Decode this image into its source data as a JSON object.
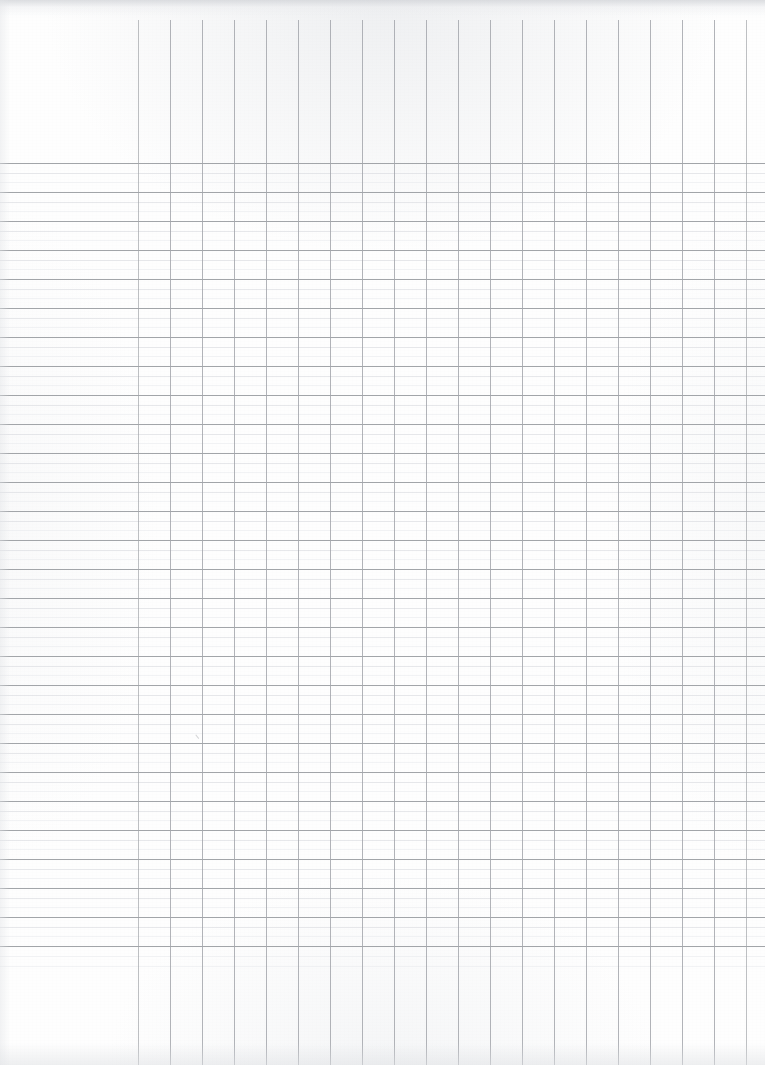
{
  "document": {
    "kind": "blank-columnar-ledger-paper",
    "title": "Blank Columnar Ledger Paper",
    "description": "Scanned sheet of blank accounting / columnar ledger paper with no printed text, no headings and no handwritten entries.",
    "orientation": "portrait",
    "page_width_px": 765,
    "page_height_px": 1065,
    "paper_color": "#fefefe",
    "has_text_content": false,
    "visible_text": []
  },
  "grid": {
    "description_column": {
      "name": "description-column",
      "left_px": 0,
      "right_px": 138,
      "width_px": 138,
      "has_vertical_rules": false
    },
    "vertical_rules": {
      "count": 20,
      "first_x_px": 138,
      "spacing_px": 32,
      "last_x_px": 746,
      "start_y_px": 20,
      "end_y_px": 1065,
      "color": "#a3a6ab",
      "weight_px": 1,
      "x_positions": [
        138,
        170,
        202,
        234,
        266,
        298,
        330,
        362,
        394,
        426,
        458,
        490,
        522,
        554,
        586,
        618,
        650,
        682,
        714,
        746
      ]
    },
    "money_columns": {
      "count": 19,
      "note": "Narrow amount columns formed between adjacent vertical rules."
    },
    "horizontal_rules": {
      "major_count": 28,
      "first_major_y_px": 163,
      "major_spacing_px": 29,
      "last_major_y_px": 946,
      "major_color": "#9a9da2",
      "minor_per_cell": 2,
      "minor_color": "#d8dade",
      "hair_color": "#e7e9ec",
      "weight_px": 1,
      "top_margin_y_px": 155,
      "bottom_margin_y_px": 960
    },
    "writing_rows": {
      "count": 27,
      "row_height_px": 29
    }
  },
  "marks": [
    {
      "name": "stray-pencil-tick",
      "x_px": 196,
      "y_px": 732,
      "kind": "faint pencil tick",
      "text": ""
    }
  ],
  "chart_data": {
    "type": "table",
    "xlabel": "",
    "ylabel": "",
    "columns": [
      "Description",
      "1",
      "2",
      "3",
      "4",
      "5",
      "6",
      "7",
      "8",
      "9",
      "10",
      "11",
      "12",
      "13",
      "14",
      "15",
      "16",
      "17",
      "18",
      "19"
    ],
    "rows": [],
    "note": "Sheet is entirely blank — 19 ruled amount columns and 27 ruled writing rows contain no entries."
  }
}
